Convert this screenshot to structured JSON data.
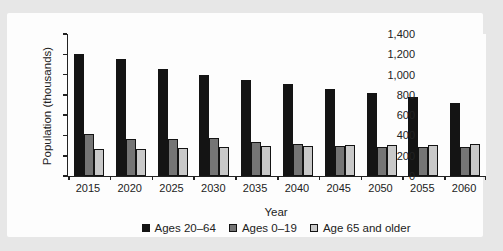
{
  "chart_data": {
    "type": "bar",
    "title": "",
    "xlabel": "Year",
    "ylabel": "Population (thousands)",
    "categories": [
      "2015",
      "2020",
      "2025",
      "2030",
      "2035",
      "2040",
      "2045",
      "2050",
      "2055",
      "2060"
    ],
    "series": [
      {
        "name": "Ages 20–64",
        "color": "#141414",
        "values": [
          1200,
          1150,
          1060,
          1000,
          945,
          905,
          860,
          820,
          775,
          720
        ]
      },
      {
        "name": "Ages 0–19",
        "color": "#757575",
        "values": [
          410,
          370,
          370,
          375,
          335,
          320,
          300,
          290,
          285,
          290
        ]
      },
      {
        "name": "Age 65 and older",
        "color": "#c9c9c9",
        "values": [
          270,
          270,
          275,
          290,
          300,
          300,
          305,
          305,
          310,
          320
        ]
      }
    ],
    "ylim": [
      0,
      1400
    ],
    "ytick_step": 200,
    "ytick_labels": [
      "0",
      "200",
      "400",
      "600",
      "800",
      "1,000",
      "1,200",
      "1,400"
    ],
    "grid": false,
    "legend_position": "bottom",
    "bar_outline_color": "#141414",
    "axis_color": "#222222",
    "panel_background": "#fdfdfd",
    "page_background": "#e7e7e7"
  }
}
